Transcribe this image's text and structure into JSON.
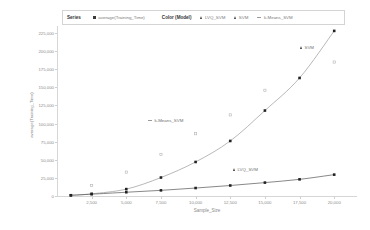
{
  "legend": {
    "series_title": "Series",
    "series_entries": [
      {
        "label": "average(Training_Time)",
        "marker": "square-filled-icon"
      }
    ],
    "color_title": "Color (Model)",
    "color_entries": [
      {
        "label": "LVQ_SVM",
        "marker": "triangle-icon"
      },
      {
        "label": "SVM",
        "marker": "triangle-icon"
      },
      {
        "label": "k-Means_SVM",
        "marker": "dash-line-icon"
      }
    ]
  },
  "annotations": [
    {
      "name": "annotation-kmeans",
      "label": "k-Means_SVM",
      "marker": "dash-line-icon",
      "x": 148,
      "y": 118
    },
    {
      "name": "annotation-svm",
      "label": "SVM",
      "marker": "triangle-icon",
      "x": 300,
      "y": 45
    },
    {
      "name": "annotation-lvq",
      "label": "LVQ_SVM",
      "marker": "triangle-icon",
      "x": 233,
      "y": 167
    }
  ],
  "chart_data": {
    "type": "line",
    "title": "",
    "xlabel": "Sample_Size",
    "ylabel": "average(Training_Time)",
    "xlim": [
      0,
      21500
    ],
    "ylim": [
      0,
      232000
    ],
    "grid": false,
    "legend_position": "top",
    "x_ticks": [
      2500,
      5000,
      7500,
      10000,
      12500,
      15000,
      17500,
      20000
    ],
    "x_tick_labels": [
      "2,500",
      "5,000",
      "7,500",
      "10,000",
      "12,500",
      "15,000",
      "17,500",
      "20,000"
    ],
    "y_ticks": [
      0,
      25000,
      50000,
      75000,
      100000,
      125000,
      150000,
      175000,
      200000,
      225000
    ],
    "y_tick_labels": [
      "0",
      "25,000",
      "50,000",
      "75,000",
      "100,000",
      "125,000",
      "150,000",
      "175,000",
      "200,000",
      "225,000"
    ],
    "x": [
      1000,
      2500,
      5000,
      7500,
      10000,
      12500,
      15000,
      17500,
      20000
    ],
    "series": [
      {
        "name": "SVM",
        "style": "line-marker",
        "color": "#9a9a9a",
        "marker_color": "#222222",
        "values": [
          1000,
          3000,
          9500,
          25500,
          47000,
          76000,
          118000,
          163000,
          228000
        ]
      },
      {
        "name": "LVQ_SVM",
        "style": "line-marker",
        "color": "#555555",
        "marker_color": "#222222",
        "values": [
          1000,
          2500,
          5200,
          7800,
          11000,
          14500,
          18500,
          23000,
          29500
        ]
      },
      {
        "name": "k-Means_SVM",
        "style": "scatter",
        "color": "#b0b0b0",
        "marker_color": "#b5b5b5",
        "values": [
          null,
          14500,
          33000,
          57500,
          86000,
          112000,
          146000,
          null,
          185000
        ]
      }
    ]
  }
}
